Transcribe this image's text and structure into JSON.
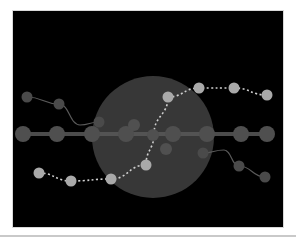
{
  "diagram": {
    "background": "#000000",
    "frame": {
      "x": 12,
      "y": 10,
      "w": 272,
      "h": 218
    },
    "big_circle": {
      "cx": 153,
      "cy": 137,
      "r": 61,
      "fill": "#3a3a3a"
    },
    "colors": {
      "main_node": "#4f4f4f",
      "inner_node": "#505050",
      "branch_node": "#4a4a4a",
      "branch_line": "#5a5a5a",
      "dashed_node": "#a9a9a9",
      "dashed_line": "#cfcfcf",
      "main_line": "#595959"
    },
    "main_line": {
      "y": 134,
      "x1": 23,
      "x2": 267
    },
    "main_nodes": [
      {
        "x": 23,
        "y": 134,
        "r": 8
      },
      {
        "x": 57,
        "y": 134,
        "r": 8
      },
      {
        "x": 92,
        "y": 134,
        "r": 8
      },
      {
        "x": 126,
        "y": 134,
        "r": 8
      },
      {
        "x": 173,
        "y": 134,
        "r": 8
      },
      {
        "x": 207,
        "y": 134,
        "r": 8
      },
      {
        "x": 241,
        "y": 134,
        "r": 8
      },
      {
        "x": 267,
        "y": 134,
        "r": 8
      }
    ],
    "inner_nodes": [
      {
        "x": 153,
        "y": 135,
        "r": 6
      },
      {
        "x": 134,
        "y": 125,
        "r": 6
      },
      {
        "x": 166,
        "y": 149,
        "r": 6
      }
    ],
    "branch_upper_left": [
      {
        "x": 27,
        "y": 97
      },
      {
        "x": 59,
        "y": 104
      },
      {
        "x": 80,
        "y": 125
      },
      {
        "x": 99,
        "y": 122
      }
    ],
    "branch_lower_right": [
      {
        "x": 203,
        "y": 153
      },
      {
        "x": 224,
        "y": 150
      },
      {
        "x": 239,
        "y": 166
      },
      {
        "x": 265,
        "y": 177
      }
    ],
    "dashed_path": [
      {
        "x": 39,
        "y": 173
      },
      {
        "x": 71,
        "y": 181
      },
      {
        "x": 111,
        "y": 179
      },
      {
        "x": 146,
        "y": 165
      },
      {
        "x": 154,
        "y": 134
      },
      {
        "x": 168,
        "y": 97
      },
      {
        "x": 199,
        "y": 88
      },
      {
        "x": 234,
        "y": 88
      },
      {
        "x": 267,
        "y": 95
      }
    ],
    "dashed_nodes": [
      {
        "x": 39,
        "y": 173
      },
      {
        "x": 71,
        "y": 181
      },
      {
        "x": 111,
        "y": 179
      },
      {
        "x": 146,
        "y": 165
      },
      {
        "x": 168,
        "y": 97
      },
      {
        "x": 199,
        "y": 88
      },
      {
        "x": 234,
        "y": 88
      },
      {
        "x": 267,
        "y": 95
      }
    ]
  }
}
